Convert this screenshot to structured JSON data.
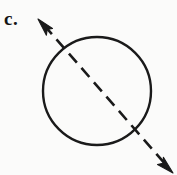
{
  "figure": {
    "label": "c.",
    "caption": "",
    "background_color": "#fbfbfa",
    "ink_color": "#1a1a1a",
    "elements": {
      "circle": {
        "name": "circle",
        "center_x": 97,
        "center_y": 91,
        "radius": 54,
        "stroke_width": 2.4,
        "fill": "none",
        "stroke_color": "#1a1a1a"
      },
      "axis_line": {
        "name": "dashed-diagonal-axis",
        "style": "dashed",
        "stroke_width": 2.6,
        "stroke_color": "#1a1a1a",
        "dash_length": 12,
        "gap_length": 7,
        "start_x": 40,
        "start_y": 21,
        "end_x": 170,
        "end_y": 170,
        "angle_degrees": 48.9,
        "passes_through_center": true,
        "arrowheads": "both"
      },
      "arrowhead_upper_left": {
        "name": "arrowhead-upper-left",
        "tip_x": 38,
        "tip_y": 19,
        "direction": "up-left"
      },
      "arrowhead_lower_right": {
        "name": "arrowhead-lower-right",
        "tip_x": 172,
        "tip_y": 172,
        "direction": "down-right"
      }
    }
  }
}
